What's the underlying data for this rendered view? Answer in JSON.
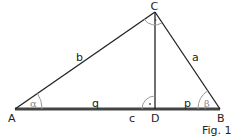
{
  "figure": {
    "caption": "Fig. 1",
    "vertices": {
      "A": {
        "label": "A",
        "x": 15,
        "y": 109
      },
      "B": {
        "label": "B",
        "x": 220,
        "y": 109
      },
      "C": {
        "label": "C",
        "x": 155,
        "y": 12
      },
      "D": {
        "label": "D",
        "x": 155,
        "y": 109
      }
    },
    "sides": {
      "a": "a",
      "b": "b",
      "c": "c",
      "p": "p",
      "q": "q"
    },
    "angles": {
      "alpha": "α",
      "beta": "β",
      "right_angle_mark": "·"
    },
    "colors": {
      "line": "#222222",
      "base": "#444444",
      "arc": "#9a9a9a",
      "greek": "#8a8a8a"
    }
  }
}
